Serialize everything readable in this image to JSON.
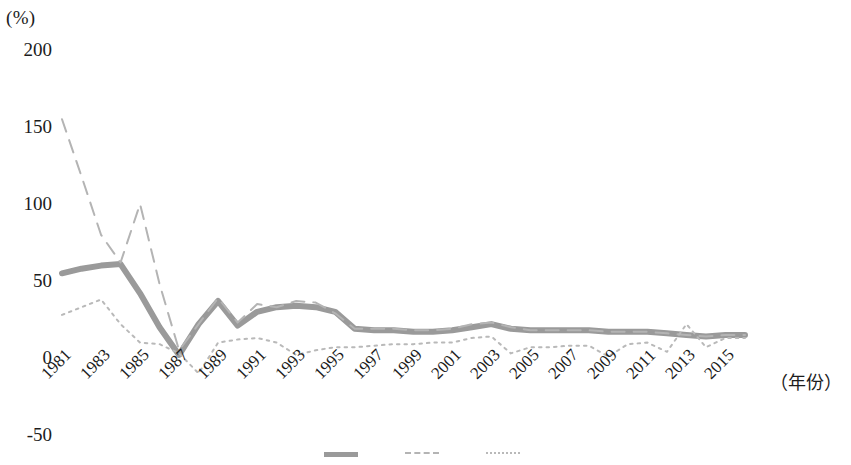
{
  "chart_data": {
    "type": "line",
    "title": "",
    "xlabel": "（年份）",
    "ylabel": "(%)",
    "ylim": [
      -50,
      200
    ],
    "yticks": [
      200,
      150,
      100,
      50,
      0,
      -50
    ],
    "ytick_labels": [
      "200",
      "150",
      "100",
      "50",
      "0",
      "-50"
    ],
    "xlim": [
      1981,
      2016
    ],
    "xticks": [
      1981,
      1983,
      1985,
      1987,
      1989,
      1991,
      1993,
      1995,
      1997,
      1999,
      2001,
      2003,
      2005,
      2007,
      2009,
      2011,
      2013,
      2015
    ],
    "xtick_labels": [
      "1981",
      "1983",
      "1985",
      "1987",
      "1989",
      "1991",
      "1993",
      "1995",
      "1997",
      "1999",
      "2001",
      "2003",
      "2005",
      "2007",
      "2009",
      "2011",
      "2013",
      "2015"
    ],
    "grid": false,
    "legend_position": "bottom",
    "x": [
      1981,
      1982,
      1983,
      1984,
      1985,
      1986,
      1987,
      1988,
      1989,
      1990,
      1991,
      1992,
      1993,
      1994,
      1995,
      1996,
      1997,
      1998,
      1999,
      2000,
      2001,
      2002,
      2003,
      2004,
      2005,
      2006,
      2007,
      2008,
      2009,
      2010,
      2011,
      2012,
      2013,
      2014,
      2015,
      2016
    ],
    "series": [
      {
        "name": "series-solid-thick",
        "style": "solid",
        "color": "#9a9a9a",
        "width": 6,
        "values": [
          55,
          58,
          60,
          61,
          42,
          20,
          2,
          22,
          37,
          21,
          30,
          33,
          34,
          33,
          30,
          19,
          18,
          18,
          17,
          17,
          18,
          20,
          22,
          19,
          18,
          18,
          18,
          18,
          17,
          17,
          17,
          16,
          15,
          14,
          15,
          15
        ]
      },
      {
        "name": "series-dashed",
        "style": "dashed",
        "color": "#b4b4b4",
        "width": 2,
        "values": [
          155,
          118,
          80,
          62,
          100,
          48,
          5,
          22,
          39,
          23,
          35,
          33,
          37,
          36,
          29,
          19,
          19,
          19,
          18,
          18,
          19,
          22,
          23,
          20,
          18,
          18,
          18,
          18,
          17,
          17,
          17,
          16,
          15,
          14,
          15,
          15
        ]
      },
      {
        "name": "series-dotted",
        "style": "dotted",
        "color": "#b9b9b9",
        "width": 2,
        "values": [
          28,
          33,
          38,
          22,
          10,
          9,
          3,
          -10,
          10,
          12,
          13,
          10,
          2,
          5,
          7,
          7,
          8,
          9,
          9,
          10,
          10,
          13,
          14,
          3,
          7,
          7,
          8,
          8,
          1,
          9,
          10,
          4,
          22,
          7,
          13,
          13
        ]
      }
    ]
  },
  "legend": {
    "items": [
      {
        "label": "",
        "style": "solid"
      },
      {
        "label": "",
        "style": "dashed"
      },
      {
        "label": "",
        "style": "dotted"
      }
    ]
  }
}
